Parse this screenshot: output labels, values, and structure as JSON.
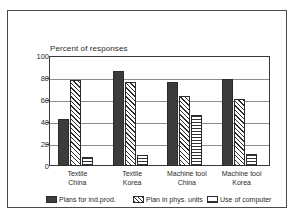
{
  "chart_data": {
    "type": "bar",
    "title": "Percent of responses",
    "xlabel": "",
    "ylabel": "",
    "ylim": [
      0,
      100
    ],
    "yticks": [
      "0",
      "20",
      "40",
      "60",
      "80",
      "100"
    ],
    "grid": true,
    "legend_position": "bottom",
    "categories": [
      "Textile\nChina",
      "Textile\nKorea",
      "Machine tool\nChina",
      "Machine tool\nKorea"
    ],
    "category_lines": [
      [
        "Textile",
        "China"
      ],
      [
        "Textile",
        "Korea"
      ],
      [
        "Machine tool",
        "China"
      ],
      [
        "Machine tool",
        "Korea"
      ]
    ],
    "series": [
      {
        "name": "Plans for ind.prod.",
        "fill": "solid-dark",
        "color": "#3c3c3c",
        "values": [
          43,
          86,
          76,
          79
        ]
      },
      {
        "name": "Plan in phys. units",
        "fill": "diagonal-hatch",
        "color": "#2e2e2e",
        "values": [
          78,
          76,
          64,
          61
        ]
      },
      {
        "name": "Use of computer",
        "fill": "cross-hatch",
        "color": "#333333",
        "values": [
          8,
          10,
          46,
          11
        ]
      }
    ]
  },
  "axis": {
    "tick_labels": [
      "100",
      "80",
      "60",
      "40",
      "20",
      "0"
    ],
    "tick_values": [
      100,
      80,
      60,
      40,
      20,
      0
    ]
  },
  "legend": {
    "items": [
      {
        "label": "Plans for ind.prod."
      },
      {
        "label": "Plan in phys. units"
      },
      {
        "label": "Use of computer"
      }
    ]
  }
}
